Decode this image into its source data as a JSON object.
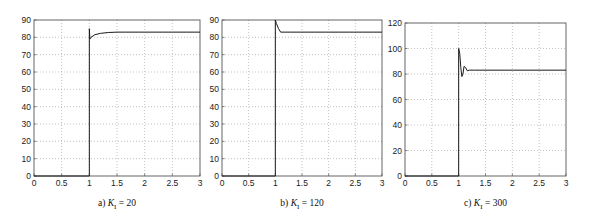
{
  "figure": {
    "captions": [
      "a) K_I = 20",
      "b) K_I = 120",
      "c) K_I = 300"
    ]
  },
  "chart_data": [
    {
      "type": "line",
      "title": "",
      "caption": "a) K_I = 20",
      "caption_parts": {
        "prefix": "a) ",
        "var": "K",
        "sub": "I",
        "suffix": " = 20"
      },
      "xlabel": "",
      "ylabel": "",
      "xlim": [
        0,
        3
      ],
      "ylim": [
        0,
        90
      ],
      "xticks": [
        0,
        0.5,
        1,
        1.5,
        2,
        2.5,
        3
      ],
      "xtick_labels": [
        "0",
        "0.5",
        "1",
        "1.5",
        "2",
        "2.5",
        "3"
      ],
      "yticks": [
        0,
        10,
        20,
        30,
        40,
        50,
        60,
        70,
        80,
        90
      ],
      "ytick_labels": [
        "0",
        "10",
        "20",
        "30",
        "40",
        "50",
        "60",
        "70",
        "80",
        "90"
      ],
      "grid": true,
      "series": [
        {
          "name": "response",
          "x": [
            0,
            1.0,
            1.0,
            1.01,
            1.03,
            1.1,
            1.2,
            1.35,
            1.5,
            1.7,
            2.0,
            2.5,
            3.0
          ],
          "y": [
            0,
            0,
            85,
            79,
            80,
            81.5,
            82.3,
            82.8,
            83,
            83,
            83,
            83,
            83
          ]
        }
      ]
    },
    {
      "type": "line",
      "title": "",
      "caption": "b) K_I = 120",
      "caption_parts": {
        "prefix": "b) ",
        "var": "K",
        "sub": "I",
        "suffix": " = 120"
      },
      "xlabel": "",
      "ylabel": "",
      "xlim": [
        0,
        3
      ],
      "ylim": [
        0,
        90
      ],
      "xticks": [
        0,
        0.5,
        1,
        1.5,
        2,
        2.5,
        3
      ],
      "xtick_labels": [
        "0",
        "0.5",
        "1",
        "1.5",
        "2",
        "2.5",
        "3"
      ],
      "yticks": [
        0,
        10,
        20,
        30,
        40,
        50,
        60,
        70,
        80,
        90
      ],
      "ytick_labels": [
        "0",
        "10",
        "20",
        "30",
        "40",
        "50",
        "60",
        "70",
        "80",
        "90"
      ],
      "grid": true,
      "series": [
        {
          "name": "response",
          "x": [
            0,
            1.0,
            1.0,
            1.02,
            1.06,
            1.1,
            1.2,
            2.0,
            3.0
          ],
          "y": [
            0,
            0,
            90,
            88,
            85,
            83,
            83,
            83,
            83
          ]
        }
      ]
    },
    {
      "type": "line",
      "title": "",
      "caption": "c) K_I = 300",
      "caption_parts": {
        "prefix": "c) ",
        "var": "K",
        "sub": "I",
        "suffix": " = 300"
      },
      "xlabel": "",
      "ylabel": "",
      "xlim": [
        0,
        3
      ],
      "ylim": [
        0,
        120
      ],
      "xticks": [
        0,
        0.5,
        1,
        1.5,
        2,
        2.5,
        3
      ],
      "xtick_labels": [
        "0",
        "0.5",
        "1",
        "1.5",
        "2",
        "2.5",
        "3"
      ],
      "yticks": [
        0,
        20,
        40,
        60,
        80,
        100,
        120
      ],
      "ytick_labels": [
        "0",
        "20",
        "40",
        "60",
        "80",
        "100",
        "120"
      ],
      "grid": true,
      "series": [
        {
          "name": "response",
          "x": [
            0,
            1.0,
            1.0,
            1.02,
            1.04,
            1.06,
            1.08,
            1.1,
            1.13,
            1.16,
            1.2,
            1.3,
            2.0,
            3.0
          ],
          "y": [
            0,
            0,
            100,
            96,
            85,
            78,
            80,
            86,
            85,
            82.5,
            83,
            83,
            83,
            83
          ]
        }
      ]
    }
  ],
  "layout": {
    "panels": [
      {
        "x0": 34,
        "x1": 200,
        "y0": 20,
        "y1": 176
      },
      {
        "x0": 222,
        "x1": 382,
        "y0": 20,
        "y1": 176
      },
      {
        "x0": 405,
        "x1": 566,
        "y0": 23,
        "y1": 176
      }
    ],
    "caption_y": 206
  }
}
